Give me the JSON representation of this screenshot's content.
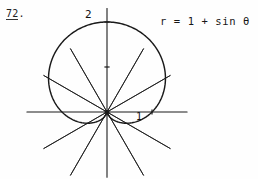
{
  "page": {
    "background": "#fefefe",
    "ink_color": "#1a1a1a"
  },
  "problem": {
    "number": "72",
    "period": ".",
    "full": "72."
  },
  "equation": {
    "text": "r = 1 + sin θ"
  },
  "labels": {
    "radius_two": "2",
    "radius_one": "1"
  },
  "chart_data": {
    "type": "line",
    "plot_kind": "polar",
    "title": "",
    "equation": "r = 1 + sin θ",
    "curve_name": "cardioid",
    "xlabel": "",
    "ylabel": "",
    "polar_origin_px": [
      107,
      112
    ],
    "unit_radius_px": 45,
    "grid": true,
    "grid_kind": "polar-rays",
    "ray_angles_deg": [
      0,
      30,
      60,
      90,
      120,
      150,
      180,
      210,
      240,
      270,
      300,
      330
    ],
    "ray_length_units": 1.62,
    "axes": {
      "horizontal_from_units": -1.78,
      "horizontal_to_units": 1.78,
      "vertical_from_units": -1.45,
      "vertical_to_units": 2.3
    },
    "tick_marks": [
      {
        "label": "2",
        "r": 2,
        "theta_deg": 90
      },
      {
        "label": "1",
        "r": 1,
        "theta_deg": 0
      }
    ],
    "theta_deg": [
      0,
      15,
      30,
      45,
      60,
      75,
      90,
      105,
      120,
      135,
      150,
      165,
      180,
      195,
      210,
      225,
      240,
      255,
      270,
      285,
      300,
      315,
      330,
      345,
      360
    ],
    "r_values": [
      1.0,
      1.259,
      1.5,
      1.707,
      1.866,
      1.966,
      2.0,
      1.966,
      1.866,
      1.707,
      1.5,
      1.259,
      1.0,
      0.741,
      0.5,
      0.293,
      0.134,
      0.034,
      0.0,
      0.034,
      0.134,
      0.293,
      0.5,
      0.741,
      1.0
    ],
    "rmax": 2,
    "rmin": 0,
    "cusp_theta_deg": 270,
    "max_r_theta_deg": 90,
    "legend": []
  }
}
